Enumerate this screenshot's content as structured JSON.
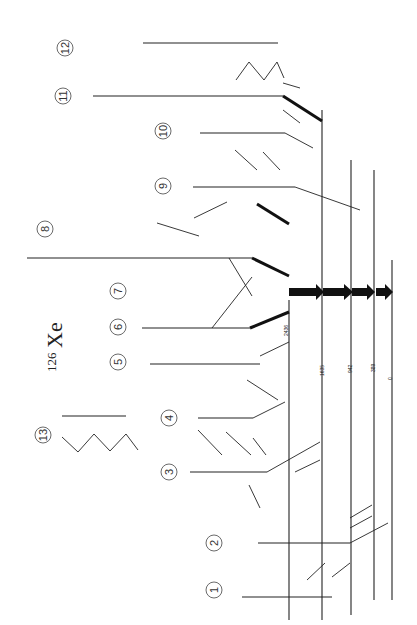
{
  "title": {
    "mass": "126",
    "element": "Xe"
  },
  "ground": {
    "energy": "0",
    "spin": "0+"
  },
  "yrast": [
    {
      "spin": "2+",
      "energy": "389",
      "gamma": "389"
    },
    {
      "spin": "4+",
      "energy": "942",
      "gamma": "553"
    },
    {
      "spin": "6+",
      "energy": "1635",
      "gamma": "693"
    },
    {
      "spin": "8+",
      "energy": "2436",
      "gamma": "801"
    }
  ],
  "bands": [
    {
      "id": "1",
      "y": 562,
      "x0": 270,
      "x1": 332,
      "levels": [
        {
          "energy": "1318",
          "spin": "3+"
        },
        {
          "energy": "1904",
          "spin": "5+"
        },
        {
          "energy": "2661",
          "spin": "7+"
        },
        {
          "energy": "3520",
          "spin": ""
        }
      ],
      "gammas": [
        "586",
        "758",
        "858"
      ]
    },
    {
      "id": "2",
      "y": 404,
      "x0": 258,
      "x1": 350,
      "levels": [
        {
          "energy": "880",
          "spin": "2+"
        },
        {
          "energy": "1488",
          "spin": "4+"
        },
        {
          "energy": "2214",
          "spin": "6+"
        },
        {
          "energy": "3062",
          "spin": ""
        }
      ],
      "gammas": [
        "609",
        "726",
        "847"
      ]
    },
    {
      "id": "3",
      "y": 185,
      "x0": 190,
      "x1": 267,
      "levels": [
        {
          "energy": "2881",
          "spin": "7-"
        },
        {
          "energy": "3295",
          "spin": "(9-)"
        },
        {
          "energy": "3964",
          "spin": "(11-)"
        },
        {
          "energy": "4701",
          "spin": ""
        }
      ],
      "gammas": [
        "414",
        "669",
        "737"
      ]
    },
    {
      "id": "4",
      "y": 432,
      "x0": 198,
      "x1": 253,
      "levels": [
        {
          "energy": "3186",
          "spin": "(8-)"
        },
        {
          "energy": "3676",
          "spin": ""
        },
        {
          "energy": "4497",
          "spin": ""
        }
      ],
      "gammas": [
        "611",
        "722"
      ]
    },
    {
      "id": "5",
      "y": 497,
      "x0": 152,
      "x1": 260,
      "levels": [
        {
          "energy": "3117",
          "spin": ""
        },
        {
          "energy": "3384",
          "spin": ""
        },
        {
          "energy": "3999",
          "spin": ""
        },
        {
          "energy": "4765",
          "spin": ""
        },
        {
          "energy": "5695",
          "spin": ""
        }
      ],
      "gammas": [
        "267",
        "615",
        "771",
        "926"
      ]
    },
    {
      "id": "6",
      "y": 385,
      "x0": 143,
      "x1": 250,
      "levels": [
        {
          "energy": "3160",
          "spin": "10+"
        },
        {
          "energy": "4074",
          "spin": "(12+)"
        },
        {
          "energy": "5090",
          "spin": ""
        },
        {
          "energy": "5923",
          "spin": ""
        }
      ],
      "gammas": [
        "915",
        "916",
        "833"
      ]
    },
    {
      "id": "7",
      "y": 173,
      "x0": 28,
      "x1": 253,
      "levels": [
        {
          "energy": "3314",
          "spin": "10+"
        },
        {
          "energy": "3895",
          "spin": "12+"
        },
        {
          "energy": "4630",
          "spin": "14+"
        },
        {
          "energy": "5626",
          "spin": "(16+)"
        },
        {
          "energy": "6510",
          "spin": "(18+)"
        },
        {
          "energy": "7587",
          "spin": "(20+)"
        },
        {
          "energy": "8745",
          "spin": ""
        }
      ],
      "gammas": [
        "878",
        "581",
        "735",
        "889",
        "1001",
        "1018",
        "1158"
      ]
    },
    {
      "id": "9",
      "y": 560,
      "x0": 195,
      "x1": 295,
      "levels": [
        {
          "energy": "2516",
          "spin": ""
        },
        {
          "energy": "2876",
          "spin": "7-"
        },
        {
          "energy": "3215",
          "spin": "(9-)"
        },
        {
          "energy": "3921",
          "spin": ""
        },
        {
          "energy": "4133",
          "spin": ""
        }
      ],
      "gammas": [
        "378",
        "547",
        "702",
        "812"
      ]
    },
    {
      "id": "10",
      "y": 400,
      "x0": 202,
      "x1": 285,
      "levels": [
        {
          "energy": "2862",
          "spin": "6-"
        },
        {
          "energy": "3394",
          "spin": "(8-)"
        },
        {
          "energy": "3762",
          "spin": ""
        },
        {
          "energy": "4533",
          "spin": ""
        }
      ],
      "gammas": [
        "523",
        "666",
        "771"
      ]
    },
    {
      "id": "11",
      "y": 290,
      "x0": 93,
      "x1": 283,
      "levels": [
        {
          "energy": "2351",
          "spin": "7-"
        },
        {
          "energy": "3064",
          "spin": "9-"
        },
        {
          "energy": "3784",
          "spin": "11-"
        },
        {
          "energy": "4567",
          "spin": ""
        },
        {
          "energy": "5393",
          "spin": ""
        },
        {
          "energy": "6248",
          "spin": ""
        },
        {
          "energy": "7186",
          "spin": ""
        }
      ],
      "gammas": [
        "714",
        "719",
        "784",
        "826",
        "856",
        "937"
      ]
    },
    {
      "id": "12",
      "y": 130,
      "x0": 143,
      "x1": 278,
      "levels": [
        {
          "energy": "2799",
          "spin": "8-"
        },
        {
          "energy": "3446",
          "spin": "10-"
        },
        {
          "energy": "4241",
          "spin": "12-"
        },
        {
          "energy": "5098",
          "spin": ""
        },
        {
          "energy": "6014",
          "spin": ""
        }
      ],
      "gammas": [
        "648",
        "794",
        "857",
        "916"
      ]
    },
    {
      "id": "13",
      "y": 20,
      "x0": 62,
      "x1": 127,
      "levels": [],
      "gammas": [
        "818",
        "733",
        "397",
        "421",
        "362",
        "396",
        "337",
        "280"
      ]
    }
  ],
  "band_labels": [
    {
      "id": "1",
      "x": 18,
      "y": 543
    },
    {
      "id": "2",
      "x": 18,
      "y": 400
    },
    {
      "id": "3",
      "x": 18,
      "y": 181
    },
    {
      "id": "4",
      "x": 18,
      "y": 165
    },
    {
      "id": "5",
      "x": 18,
      "y": 115
    },
    {
      "id": "6",
      "x": 18,
      "y": 128
    },
    {
      "id": "7",
      "x": 18,
      "y": 120
    },
    {
      "id": "8",
      "x": 18,
      "y": 45
    },
    {
      "id": "9",
      "x": 18,
      "y": 163
    },
    {
      "id": "10",
      "x": 18,
      "y": 163
    },
    {
      "id": "11",
      "x": 18,
      "y": 63
    },
    {
      "id": "12",
      "x": 18,
      "y": 65
    },
    {
      "id": "13",
      "x": 18,
      "y": 43
    }
  ],
  "ui": {
    "label_1": "1",
    "label_2": "2",
    "label_3": "3",
    "label_4": "4",
    "label_5": "5",
    "label_6": "6",
    "label_7": "7",
    "label_8": "8",
    "label_9": "9",
    "label_10": "10",
    "label_11": "11",
    "label_12": "12",
    "label_13": "13"
  }
}
